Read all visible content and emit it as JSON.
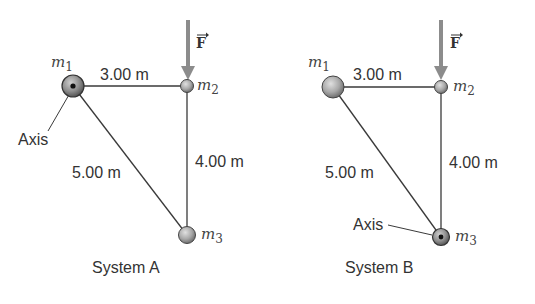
{
  "systems": [
    {
      "title": "System A",
      "masses": {
        "m1": "m",
        "m1_sub": "1",
        "m2": "m",
        "m2_sub": "2",
        "m3": "m",
        "m3_sub": "3"
      },
      "distances": {
        "m1_m2": "3.00 m",
        "m2_m3": "4.00 m",
        "m1_m3": "5.00 m"
      },
      "axis_label": "Axis",
      "axis_at": "m1",
      "force_label": "F"
    },
    {
      "title": "System B",
      "masses": {
        "m1": "m",
        "m1_sub": "1",
        "m2": "m",
        "m2_sub": "2",
        "m3": "m",
        "m3_sub": "3"
      },
      "distances": {
        "m1_m2": "3.00 m",
        "m2_m3": "4.00 m",
        "m1_m3": "5.00 m"
      },
      "axis_label": "Axis",
      "axis_at": "m3",
      "force_label": "F"
    }
  ],
  "colors": {
    "line": "#3a3a3a",
    "arrow": "#8c8c8c",
    "sphere_light": "#d8d8d8",
    "sphere_dark": "#7a7a7a",
    "text": "#333333"
  }
}
